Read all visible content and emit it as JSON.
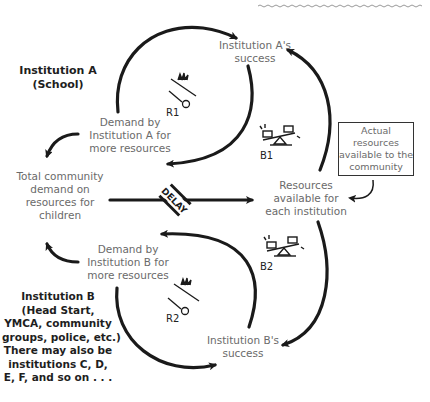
{
  "nodes": {
    "inst_a_success": [
      "Institution A's",
      "success"
    ],
    "demand_a": [
      "Demand by",
      "Institution A for",
      "more resources"
    ],
    "total_demand": [
      "Total community",
      "demand on",
      "resources for",
      "children"
    ],
    "resources_each": [
      "Resources",
      "available for",
      "each institution"
    ],
    "actual_resources": [
      "Actual",
      "resources",
      "available to the",
      "community"
    ],
    "demand_b": [
      "Demand by",
      "Institution B for",
      "more resources"
    ],
    "inst_b_success": [
      "Institution B's",
      "success"
    ]
  },
  "annotations": {
    "institution_a": [
      "Institution A",
      "(School)"
    ],
    "institution_b": [
      "Institution B",
      "(Head Start,",
      "YMCA, community",
      "groups, police, etc.)",
      "There may also be",
      "institutions C, D,",
      "E, F, and so on . . ."
    ]
  },
  "loops": {
    "r1": "R1",
    "b1": "B1",
    "b2": "B2",
    "r2": "R2"
  },
  "delay_label": "DELAY",
  "colors": {
    "arrow": "#1a1a1a",
    "node_text": "#6a6a6a",
    "bold_text": "#1e1e1e"
  }
}
